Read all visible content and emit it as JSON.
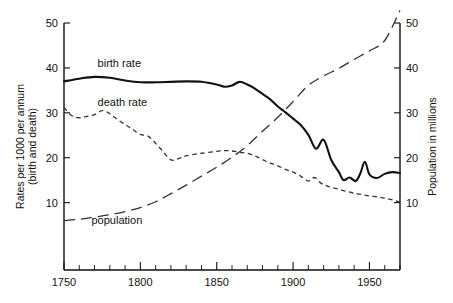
{
  "chart_data": {
    "type": "line",
    "title": "",
    "xlabel": "",
    "ylabel": "Rates per 1000 per annum (birth and death)",
    "y2label": "Population in millions",
    "xlim": [
      1750,
      1970
    ],
    "ylim": [
      0,
      50
    ],
    "y2lim": [
      0,
      50
    ],
    "grid": false,
    "legend_position": "inline-annotations",
    "x_ticks": [
      1750,
      1800,
      1850,
      1900,
      1950
    ],
    "x_tick_labels": [
      "1750",
      "1800",
      "1850",
      "1900",
      "1950"
    ],
    "x_minor_tick_interval": 10,
    "y_ticks": [
      10,
      20,
      30,
      40,
      50
    ],
    "y_tick_labels": [
      "10",
      "20",
      "30",
      "40",
      "50"
    ],
    "y2_ticks": [
      10,
      20,
      30,
      40,
      50
    ],
    "y2_tick_labels": [
      "10",
      "20",
      "30",
      "40",
      "50"
    ],
    "annotations": [
      {
        "text": "birth rate",
        "x": 1772,
        "y": 40.2
      },
      {
        "text": "death rate",
        "x": 1772,
        "y": 31.6
      },
      {
        "text": "population",
        "x": 1768,
        "y": 5.2
      }
    ],
    "series": [
      {
        "name": "birth rate",
        "style": "solid",
        "axis": "left",
        "units": "per 1000 per annum",
        "x": [
          1750,
          1760,
          1770,
          1780,
          1790,
          1800,
          1810,
          1820,
          1830,
          1840,
          1850,
          1855,
          1860,
          1865,
          1870,
          1875,
          1880,
          1885,
          1890,
          1895,
          1900,
          1905,
          1910,
          1915,
          1920,
          1925,
          1930,
          1933,
          1937,
          1941,
          1944,
          1947,
          1950,
          1955,
          1960,
          1965,
          1970
        ],
        "values": [
          37.0,
          37.6,
          38.0,
          37.8,
          37.2,
          36.8,
          36.8,
          36.9,
          37.0,
          36.9,
          36.3,
          35.8,
          36.1,
          36.9,
          36.3,
          35.4,
          34.2,
          33.0,
          31.4,
          30.1,
          28.7,
          27.3,
          25.1,
          22.0,
          24.0,
          19.5,
          16.8,
          15.0,
          15.6,
          14.8,
          16.5,
          19.1,
          16.3,
          15.5,
          16.4,
          16.8,
          16.6
        ]
      },
      {
        "name": "death rate",
        "style": "short-dash",
        "axis": "left",
        "units": "per 1000 per annum",
        "x": [
          1750,
          1755,
          1760,
          1765,
          1770,
          1775,
          1780,
          1785,
          1790,
          1795,
          1800,
          1805,
          1810,
          1815,
          1820,
          1825,
          1830,
          1840,
          1850,
          1855,
          1860,
          1865,
          1870,
          1875,
          1880,
          1885,
          1890,
          1895,
          1900,
          1905,
          1910,
          1914,
          1918,
          1921,
          1925,
          1930,
          1935,
          1940,
          1945,
          1950,
          1955,
          1960,
          1965,
          1970
        ],
        "values": [
          31.2,
          29.4,
          28.9,
          29.2,
          29.6,
          30.5,
          29.8,
          28.5,
          27.4,
          26.3,
          25.2,
          24.8,
          23.2,
          21.3,
          19.5,
          19.8,
          20.4,
          21.0,
          21.4,
          21.6,
          21.5,
          21.2,
          21.0,
          20.4,
          19.6,
          18.8,
          18.2,
          17.4,
          16.8,
          15.9,
          14.8,
          15.6,
          14.4,
          13.9,
          13.4,
          13.0,
          12.5,
          12.1,
          11.8,
          11.5,
          11.3,
          11.0,
          10.6,
          10.1
        ]
      },
      {
        "name": "population",
        "style": "long-dash",
        "axis": "right",
        "units": "millions",
        "x": [
          1750,
          1760,
          1770,
          1780,
          1790,
          1800,
          1810,
          1820,
          1830,
          1840,
          1850,
          1860,
          1870,
          1880,
          1890,
          1900,
          1910,
          1920,
          1930,
          1940,
          1950,
          1960,
          1970
        ],
        "values": [
          6.0,
          6.3,
          6.8,
          7.3,
          8.0,
          8.9,
          10.2,
          12.0,
          13.9,
          15.9,
          17.9,
          20.1,
          22.7,
          25.9,
          29.0,
          32.5,
          36.1,
          38.2,
          39.9,
          41.9,
          43.8,
          46.1,
          52.8
        ]
      }
    ]
  }
}
